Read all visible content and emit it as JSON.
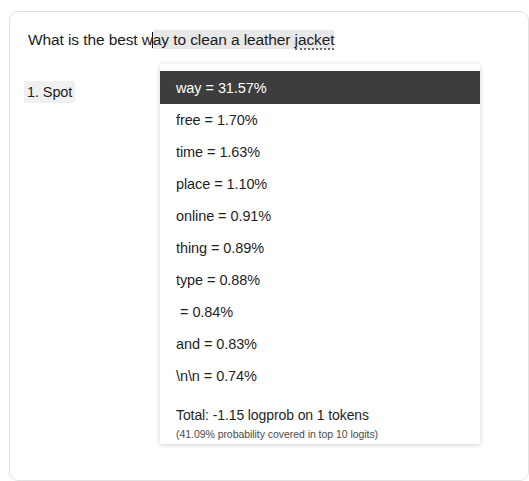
{
  "document": {
    "prompt": {
      "text_before_caret": "What is the best w",
      "text_after_caret": "ay to clean a leather ",
      "misspelled_word": "jacket",
      "full_text": "What is the best way to clean a leather jacket"
    },
    "answer": {
      "label": "1. Spot"
    }
  },
  "logits_panel": {
    "rows": [
      {
        "token": "way",
        "value": "31.57%",
        "separator": "=",
        "highlighted": true
      },
      {
        "token": "free",
        "value": "1.70%",
        "separator": "=",
        "highlighted": false
      },
      {
        "token": "time",
        "value": "1.63%",
        "separator": "=",
        "highlighted": false
      },
      {
        "token": "place",
        "value": "1.10%",
        "separator": "=",
        "highlighted": false
      },
      {
        "token": "online",
        "value": "0.91%",
        "separator": "=",
        "highlighted": false
      },
      {
        "token": "thing",
        "value": "0.89%",
        "separator": "=",
        "highlighted": false
      },
      {
        "token": "type",
        "value": "0.88%",
        "separator": "=",
        "highlighted": false
      },
      {
        "token": "",
        "value": "0.84%",
        "separator": "=",
        "highlighted": false
      },
      {
        "token": "and",
        "value": "0.83%",
        "separator": "=",
        "highlighted": false
      },
      {
        "token": "\\n\\n",
        "value": "0.74%",
        "separator": "=",
        "highlighted": false
      }
    ],
    "footer": {
      "total": "Total: -1.15 logprob on 1 tokens",
      "subtitle": "(41.09% probability covered in top 10 logits)"
    }
  },
  "colors": {
    "highlight_background": "#3d3d3d",
    "highlight_text": "#ffffff",
    "panel_background": "#ffffff",
    "text_primary": "#1f1f1f",
    "selection_wash": "#e8e8e8"
  }
}
